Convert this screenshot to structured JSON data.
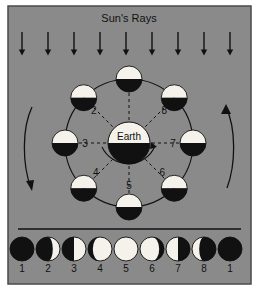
{
  "figure": {
    "title": "Sun's Rays",
    "background_color": "#8a8a8a",
    "panel_border_color": "#4a4a4a",
    "ink_color": "#111111",
    "light_color": "#f4f2ea",
    "center_body_label": "Earth"
  },
  "sun_rays": {
    "label": "Sun's Rays",
    "arrow_count": 9,
    "direction": "down",
    "arrow_x_positions": [
      22,
      48,
      74,
      100,
      126,
      152,
      178,
      204,
      230
    ],
    "arrow_y_top": 32,
    "arrow_y_bottom": 54
  },
  "orbit": {
    "center_x": 129,
    "center_y": 143,
    "radius": 64,
    "earth_radius": 21,
    "moon_radius": 13,
    "direction_arrows": {
      "left": {
        "name": "orbit-direction-arrow-left",
        "points": "down"
      },
      "right": {
        "name": "orbit-direction-arrow-right",
        "points": "up"
      },
      "center": {
        "name": "earth-rotation-arrow",
        "points": "counter-clockwise"
      }
    },
    "moons": [
      {
        "number": "1",
        "angle_deg": 270,
        "label_dx": 8,
        "label_dy": -16,
        "lit": "top",
        "show_label": false
      },
      {
        "number": "2",
        "angle_deg": 225,
        "label_dx": 10,
        "label_dy": 16,
        "lit": "top",
        "show_label": true
      },
      {
        "number": "3",
        "angle_deg": 180,
        "label_dx": 20,
        "label_dy": 4,
        "lit": "top",
        "show_label": true
      },
      {
        "number": "4",
        "angle_deg": 135,
        "label_dx": 12,
        "label_dy": -12,
        "lit": "top",
        "show_label": true
      },
      {
        "number": "5",
        "angle_deg": 90,
        "label_dx": 0,
        "label_dy": -18,
        "lit": "top",
        "show_label": true
      },
      {
        "number": "6",
        "angle_deg": 45,
        "label_dx": -12,
        "label_dy": -12,
        "lit": "top",
        "show_label": true
      },
      {
        "number": "7",
        "angle_deg": 0,
        "label_dx": -20,
        "label_dy": 4,
        "lit": "top",
        "show_label": true
      },
      {
        "number": "8",
        "angle_deg": 315,
        "label_dx": -10,
        "label_dy": 16,
        "lit": "top",
        "show_label": true
      }
    ]
  },
  "phase_strip": {
    "y_center": 249,
    "radius": 12,
    "phases": [
      {
        "number": "1",
        "x": 22,
        "name": "new-moon",
        "illumination": 0.0,
        "lit_side": "none"
      },
      {
        "number": "2",
        "x": 48,
        "name": "waxing-crescent",
        "illumination": 0.3,
        "lit_side": "right"
      },
      {
        "number": "3",
        "x": 74,
        "name": "first-quarter",
        "illumination": 0.5,
        "lit_side": "right"
      },
      {
        "number": "4",
        "x": 100,
        "name": "waxing-gibbous",
        "illumination": 0.8,
        "lit_side": "right"
      },
      {
        "number": "5",
        "x": 126,
        "name": "full-moon",
        "illumination": 1.0,
        "lit_side": "all"
      },
      {
        "number": "6",
        "x": 152,
        "name": "waning-gibbous",
        "illumination": 0.8,
        "lit_side": "left"
      },
      {
        "number": "7",
        "x": 178,
        "name": "last-quarter",
        "illumination": 0.5,
        "lit_side": "left"
      },
      {
        "number": "8",
        "x": 204,
        "name": "waning-crescent",
        "illumination": 0.3,
        "lit_side": "left"
      },
      {
        "number": "1",
        "x": 230,
        "name": "new-moon-repeat",
        "illumination": 0.0,
        "lit_side": "none"
      }
    ]
  }
}
